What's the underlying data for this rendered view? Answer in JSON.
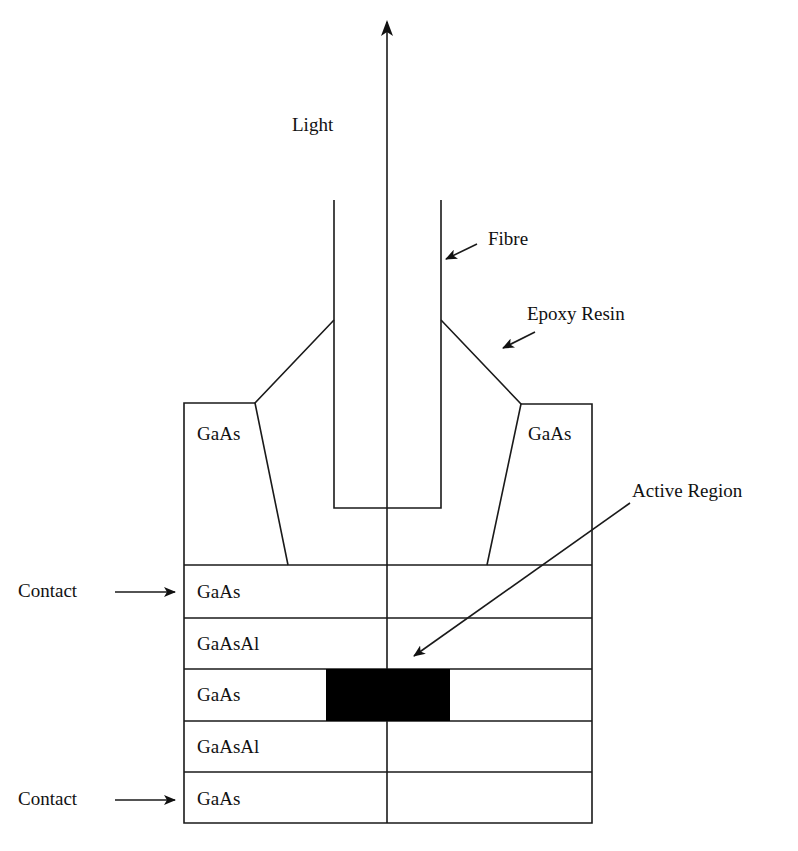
{
  "diagram": {
    "labels": {
      "light": "Light",
      "fibre": "Fibre",
      "epoxy": "Epoxy Resin",
      "active_region": "Active Region",
      "contact_top": "Contact",
      "contact_bottom": "Contact",
      "gaas_left": "GaAs",
      "gaas_right": "GaAs"
    },
    "layers": [
      {
        "material": "GaAs",
        "role": "contact"
      },
      {
        "material": "GaAsAl",
        "role": "confining"
      },
      {
        "material": "GaAs",
        "role": "active"
      },
      {
        "material": "GaAsAl",
        "role": "confining"
      },
      {
        "material": "GaAs",
        "role": "contact"
      }
    ],
    "colors": {
      "line": "#1a1a1a",
      "active_fill": "#000000",
      "background": "#ffffff"
    }
  }
}
